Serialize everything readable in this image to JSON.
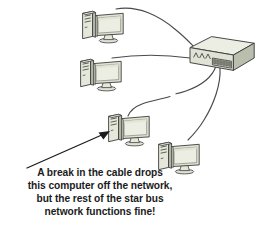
{
  "diagram": {
    "background_color": "#ffffff",
    "caption": {
      "lines": [
        "A break in the cable drops",
        "this computer off the network,",
        "but the rest of the star bus",
        "network functions fine!"
      ],
      "text_color": "#1b1b1b"
    },
    "colors": {
      "outline": "#3d3d3d",
      "cable": "#4a4a4a",
      "device_body": "#dfe2d4",
      "device_shade": "#b9bead",
      "device_top": "#eceee3",
      "screen": "#e8ece0",
      "screen_inner": "#dfe4d3",
      "arrow": "#1b1b1b",
      "port": "#8d9383"
    },
    "switch": {
      "label": "network-switch",
      "port_count": 8,
      "led_count": 4
    },
    "computers": [
      {
        "label": "computer-1",
        "connected": true
      },
      {
        "label": "computer-2",
        "connected": true
      },
      {
        "label": "computer-3",
        "connected": false
      },
      {
        "label": "computer-4",
        "connected": true
      }
    ],
    "cables": [
      {
        "label": "cable-to-computer-1",
        "broken": false
      },
      {
        "label": "cable-to-computer-2",
        "broken": false
      },
      {
        "label": "cable-to-computer-3",
        "broken": true
      },
      {
        "label": "cable-to-computer-4",
        "broken": false
      }
    ],
    "annotation": {
      "arrow_label": "pointer-arrow-to-broken-computer"
    }
  }
}
